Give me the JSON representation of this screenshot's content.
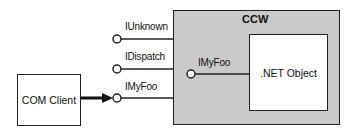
{
  "diagram": {
    "container": {
      "label": "CCW",
      "fill": "#c9c9c9"
    },
    "inner_object": {
      "label": ".NET Object"
    },
    "client": {
      "label": "COM Client"
    },
    "outer_interfaces": [
      {
        "label": "IUnknown"
      },
      {
        "label": "IDispatch"
      },
      {
        "label": "IMyFoo"
      }
    ],
    "inner_interface": {
      "label": "IMyFoo"
    },
    "connection": {
      "from": "COM Client",
      "to": "IMyFoo",
      "style": "thick-arrow"
    }
  }
}
